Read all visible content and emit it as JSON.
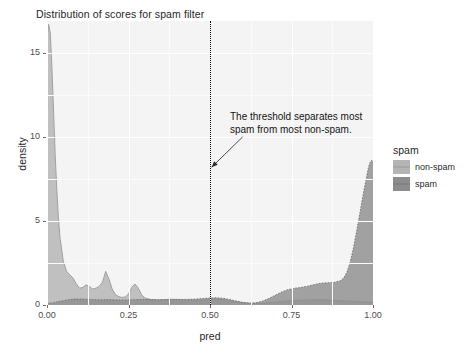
{
  "chart_data": {
    "type": "area",
    "title": "Distribution of scores for spam filter",
    "xlabel": "pred",
    "ylabel": "density",
    "xlim": [
      0.0,
      1.0
    ],
    "ylim": [
      0.0,
      16.9
    ],
    "xticks": [
      "0.00",
      "0.25",
      "0.50",
      "0.75",
      "1.00"
    ],
    "xtick_values": [
      0.0,
      0.25,
      0.5,
      0.75,
      1.0
    ],
    "yticks": [
      "0",
      "5",
      "10",
      "15"
    ],
    "ytick_values": [
      0,
      5,
      10,
      15
    ],
    "grid": true,
    "legend_position": "right",
    "legend_title": "spam",
    "series": [
      {
        "name": "non-spam",
        "color": "#b4b4b4",
        "x": [
          0.0,
          0.005,
          0.01,
          0.015,
          0.02,
          0.025,
          0.03,
          0.035,
          0.04,
          0.05,
          0.06,
          0.07,
          0.08,
          0.09,
          0.1,
          0.11,
          0.12,
          0.13,
          0.14,
          0.15,
          0.16,
          0.17,
          0.18,
          0.19,
          0.2,
          0.21,
          0.22,
          0.23,
          0.24,
          0.25,
          0.26,
          0.27,
          0.28,
          0.29,
          0.3,
          0.32,
          0.34,
          0.36,
          0.38,
          0.4,
          0.42,
          0.44,
          0.46,
          0.48,
          0.5,
          0.52,
          0.54,
          0.56,
          0.58,
          0.6,
          0.62,
          0.64,
          0.66,
          0.68,
          0.7,
          0.72,
          0.74,
          0.76,
          0.78,
          0.8,
          0.82,
          0.84,
          0.86,
          0.88,
          0.9,
          0.92,
          0.94,
          0.96,
          0.98,
          1.0
        ],
        "y": [
          15.9,
          16.7,
          16.2,
          14.2,
          11.6,
          9.0,
          6.9,
          5.2,
          4.0,
          2.6,
          2.0,
          1.8,
          1.6,
          1.25,
          1.0,
          1.05,
          1.2,
          1.1,
          0.95,
          1.0,
          1.1,
          1.35,
          2.0,
          1.55,
          0.95,
          0.62,
          0.5,
          0.45,
          0.48,
          0.65,
          1.05,
          1.25,
          1.0,
          0.62,
          0.42,
          0.32,
          0.3,
          0.32,
          0.34,
          0.33,
          0.3,
          0.28,
          0.28,
          0.3,
          0.33,
          0.34,
          0.32,
          0.27,
          0.2,
          0.14,
          0.1,
          0.09,
          0.1,
          0.13,
          0.17,
          0.21,
          0.24,
          0.26,
          0.28,
          0.3,
          0.31,
          0.31,
          0.3,
          0.28,
          0.26,
          0.24,
          0.22,
          0.2,
          0.18,
          0.16
        ]
      },
      {
        "name": "spam",
        "color": "#8c8c8c",
        "x": [
          0.0,
          0.01,
          0.02,
          0.03,
          0.04,
          0.05,
          0.06,
          0.07,
          0.08,
          0.09,
          0.1,
          0.11,
          0.12,
          0.13,
          0.14,
          0.15,
          0.16,
          0.17,
          0.18,
          0.19,
          0.2,
          0.22,
          0.24,
          0.26,
          0.28,
          0.3,
          0.32,
          0.34,
          0.36,
          0.38,
          0.4,
          0.42,
          0.44,
          0.46,
          0.48,
          0.5,
          0.52,
          0.54,
          0.56,
          0.58,
          0.6,
          0.62,
          0.64,
          0.66,
          0.68,
          0.7,
          0.72,
          0.74,
          0.76,
          0.78,
          0.8,
          0.82,
          0.84,
          0.86,
          0.88,
          0.9,
          0.91,
          0.92,
          0.93,
          0.94,
          0.95,
          0.96,
          0.97,
          0.98,
          0.985,
          0.99,
          0.995,
          1.0
        ],
        "y": [
          0.1,
          0.12,
          0.14,
          0.18,
          0.22,
          0.26,
          0.3,
          0.33,
          0.35,
          0.36,
          0.36,
          0.35,
          0.34,
          0.33,
          0.32,
          0.31,
          0.31,
          0.31,
          0.32,
          0.32,
          0.31,
          0.3,
          0.3,
          0.31,
          0.33,
          0.33,
          0.32,
          0.31,
          0.31,
          0.32,
          0.33,
          0.33,
          0.34,
          0.36,
          0.39,
          0.42,
          0.43,
          0.4,
          0.33,
          0.24,
          0.16,
          0.12,
          0.13,
          0.22,
          0.38,
          0.58,
          0.78,
          0.92,
          1.0,
          1.05,
          1.12,
          1.22,
          1.3,
          1.32,
          1.34,
          1.45,
          1.6,
          1.95,
          2.55,
          3.4,
          4.4,
          5.5,
          6.6,
          7.6,
          8.1,
          8.45,
          8.6,
          8.55
        ]
      }
    ],
    "threshold": {
      "x": 0.5,
      "style": "dotted",
      "color": "#000000"
    },
    "annotation": {
      "line1": "The threshold separates most",
      "line2": "spam from most non-spam.",
      "arrow_from": [
        0.6,
        10.0
      ],
      "arrow_to": [
        0.505,
        8.2
      ]
    }
  },
  "legend": {
    "title": "spam",
    "items": [
      {
        "label": "non-spam",
        "color": "#b4b4b4"
      },
      {
        "label": "spam",
        "color": "#8c8c8c"
      }
    ]
  },
  "colors": {
    "panel_background": "#f4f4f4",
    "grid_major": "#ffffff",
    "page_background": "#ffffff",
    "text": "#1f1f1f",
    "tick_text": "#4d4d4d"
  }
}
